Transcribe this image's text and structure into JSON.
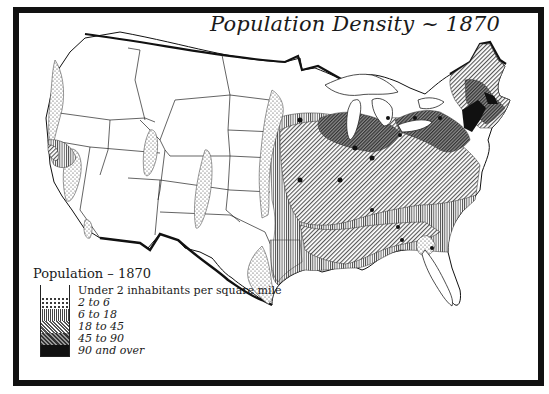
{
  "map": {
    "title": "Population Density ~ 1870",
    "subject": "United States population density by region, 1870",
    "regions_shown": [
      "Pacific Northwest",
      "California",
      "Great Basin",
      "Rocky Mountains",
      "Great Plains",
      "Midwest",
      "Great Lakes",
      "Northeast",
      "New England",
      "Southeast",
      "Gulf Coast",
      "Texas",
      "Florida"
    ],
    "features": [
      "state boundaries",
      "Great Lakes",
      "national border",
      "Gulf of Mexico coastline",
      "Atlantic coastline"
    ]
  },
  "legend": {
    "title": "Population – 1870",
    "items": [
      {
        "label": "Under 2 inhabitants per square mile",
        "pattern": "blank",
        "fill": "#ffffff"
      },
      {
        "label": "2 to 6",
        "pattern": "dots",
        "fill": "#e8e8e8"
      },
      {
        "label": "6 to 18",
        "pattern": "vertical-lines",
        "fill": "#b8b8b8"
      },
      {
        "label": "18 to 45",
        "pattern": "diagonal-lines",
        "fill": "#9a9a9a"
      },
      {
        "label": "45 to 90",
        "pattern": "dense-crosshatch",
        "fill": "#666666"
      },
      {
        "label": "90 and over",
        "pattern": "solid",
        "fill": "#111111"
      }
    ]
  },
  "colors": {
    "ink": "#111111",
    "paper": "#ffffff"
  }
}
